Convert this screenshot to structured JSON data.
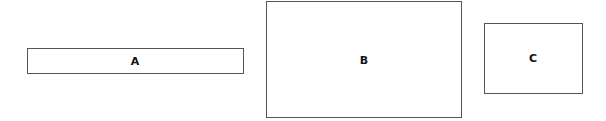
{
  "diagram": {
    "boxes": [
      {
        "id": "A",
        "label": "A"
      },
      {
        "id": "B",
        "label": "B"
      },
      {
        "id": "C",
        "label": "C"
      }
    ]
  }
}
